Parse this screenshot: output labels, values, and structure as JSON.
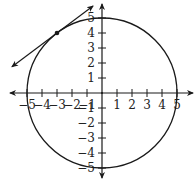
{
  "diagram": {
    "type": "coordinate-plane",
    "origin_px": [
      102,
      93
    ],
    "unit_px": 15,
    "x_ticks": [
      {
        "value": -5,
        "label": "−5"
      },
      {
        "value": -4,
        "label": "−4"
      },
      {
        "value": -3,
        "label": "−3"
      },
      {
        "value": -2,
        "label": "−2"
      },
      {
        "value": -1,
        "label": "−1"
      },
      {
        "value": 1,
        "label": "1"
      },
      {
        "value": 2,
        "label": "2"
      },
      {
        "value": 3,
        "label": "3"
      },
      {
        "value": 4,
        "label": "4"
      },
      {
        "value": 5,
        "label": "5"
      }
    ],
    "y_ticks": [
      {
        "value": 5,
        "label": "5"
      },
      {
        "value": 4,
        "label": "4"
      },
      {
        "value": 3,
        "label": "3"
      },
      {
        "value": 2,
        "label": "2"
      },
      {
        "value": 1,
        "label": "1"
      },
      {
        "value": -1,
        "label": "−1"
      },
      {
        "value": -2,
        "label": "−2"
      },
      {
        "value": -3,
        "label": "−3"
      },
      {
        "value": -4,
        "label": "−4"
      },
      {
        "value": -5,
        "label": "−5"
      }
    ],
    "circle": {
      "center": [
        0,
        0
      ],
      "radius": 5
    },
    "tangent_point": [
      -3,
      4
    ],
    "tangent_line": {
      "slope": 0.75,
      "from": [
        -6,
        1.75
      ],
      "to": [
        -0.6,
        5.8
      ]
    },
    "colors": {
      "stroke": "#1a1a1a",
      "background": "#ffffff"
    }
  }
}
